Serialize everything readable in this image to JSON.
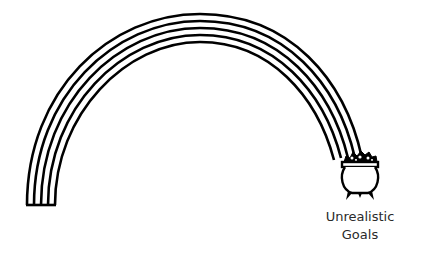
{
  "illustration": {
    "subject": "rainbow ending in pot of gold",
    "rainbow_band_count": 5,
    "stroke_color": "#000000",
    "background_color": "#ffffff"
  },
  "caption": {
    "line1": "Unrealistic",
    "line2": "Goals"
  }
}
